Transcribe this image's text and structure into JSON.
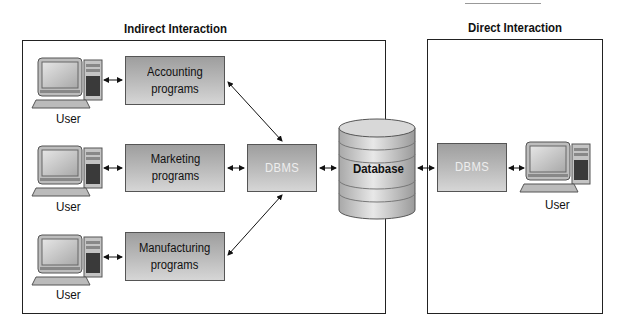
{
  "sections": {
    "indirect": {
      "title": "Indirect Interaction"
    },
    "direct": {
      "title": "Direct Interaction"
    }
  },
  "programs": [
    {
      "label": "Accounting\nprograms"
    },
    {
      "label": "Marketing\nprograms"
    },
    {
      "label": "Manufacturing\nprograms"
    }
  ],
  "users": [
    {
      "label": "User"
    },
    {
      "label": "User"
    },
    {
      "label": "User"
    },
    {
      "label": "User"
    }
  ],
  "dbms_left": {
    "label": "DBMS"
  },
  "dbms_right": {
    "label": "DBMS"
  },
  "database": {
    "label": "Database"
  },
  "colors": {
    "box_top": "#9e9e9e",
    "box_bottom": "#d6d6d6",
    "frame": "#222222"
  }
}
